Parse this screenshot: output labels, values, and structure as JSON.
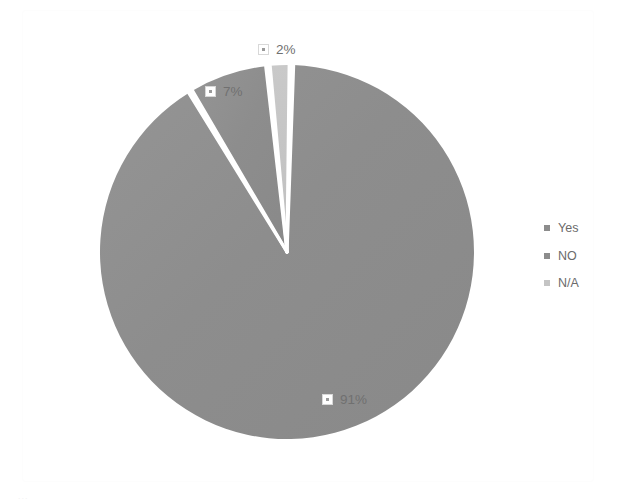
{
  "chart_data": {
    "type": "pie",
    "title": "",
    "subtitle": "",
    "xlabel": "",
    "ylabel": "",
    "grid": false,
    "legend_position": "right",
    "categories": [
      "Yes",
      "NO",
      "N/A"
    ],
    "values": [
      91,
      7,
      2
    ],
    "value_labels": [
      "91%",
      "7%",
      "2%"
    ],
    "units": "percent",
    "colors": [
      "#8c8c8c",
      "#8c8c8c",
      "#c4c4c4"
    ],
    "slice_gap_color": "#ffffff",
    "slices": [
      {
        "name": "Yes",
        "value": 91,
        "label": "91%",
        "color": "#8c8c8c"
      },
      {
        "name": "NO",
        "value": 7,
        "label": "7%",
        "color": "#8c8c8c"
      },
      {
        "name": "N/A",
        "value": 2,
        "label": "2%",
        "color": "#c4c4c4"
      }
    ]
  },
  "labels": {
    "na": {
      "value": "2%"
    },
    "no": {
      "value": "7%"
    },
    "yes": {
      "value": "91%"
    }
  },
  "legend": {
    "items": [
      {
        "label": "Yes",
        "color": "#8c8c8c"
      },
      {
        "label": "NO",
        "color": "#8c8c8c"
      },
      {
        "label": "N/A",
        "color": "#c4c4c4"
      }
    ]
  },
  "artifact": {
    "text": "..."
  },
  "colors": {
    "background": "#ffffff",
    "slice_dark": "#8c8c8c",
    "slice_light": "#c4c4c4",
    "text": "#6f6f6f"
  }
}
